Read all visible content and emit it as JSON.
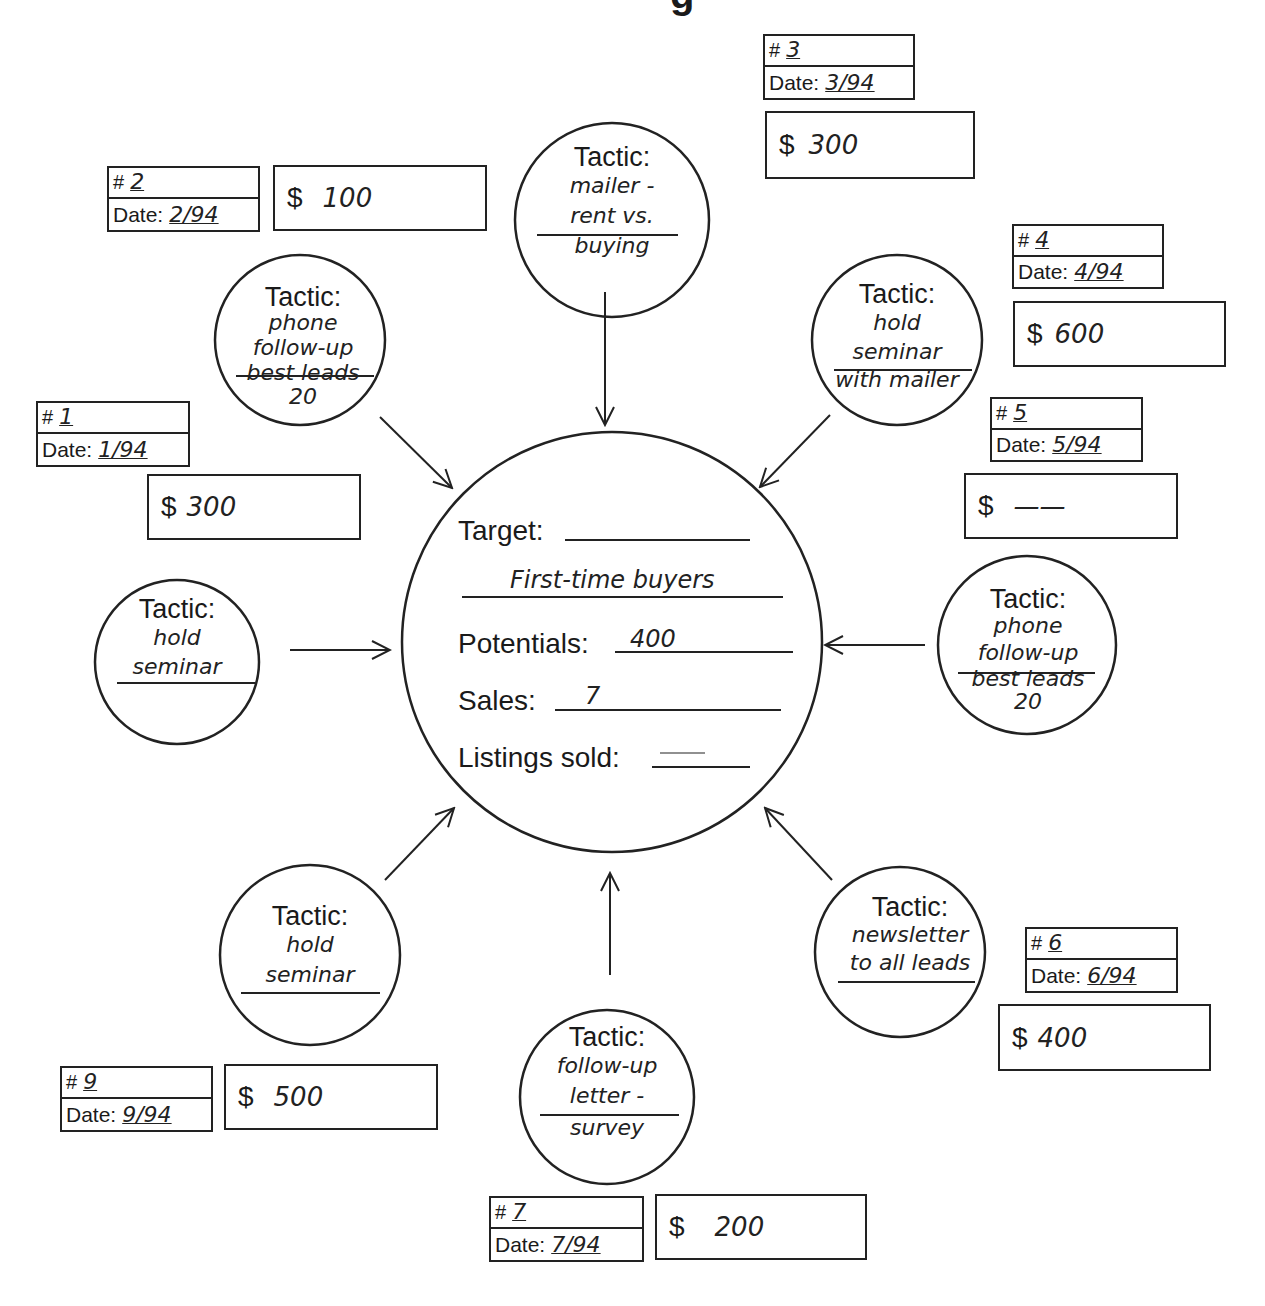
{
  "title_fragment": "g",
  "center": {
    "target_label": "Target:",
    "target_value": "First-time buyers",
    "potentials_label": "Potentials:",
    "potentials_value": "400",
    "sales_label": "Sales:",
    "sales_value": "7",
    "listings_label": "Listings sold:",
    "listings_value": "—"
  },
  "tactics": [
    {
      "number": "1",
      "date": "1/94",
      "cost": "300",
      "label": "Tactic:",
      "lines": [
        "hold",
        "seminar"
      ],
      "position": "left"
    },
    {
      "number": "2",
      "date": "2/94",
      "cost": "100",
      "label": "Tactic:",
      "lines": [
        "phone",
        "follow-up",
        "best leads",
        "20"
      ],
      "position": "top-left"
    },
    {
      "number": "3",
      "date": "3/94",
      "cost": "300",
      "label": "Tactic:",
      "lines": [
        "mailer -",
        "rent vs.",
        "buying"
      ],
      "position": "top"
    },
    {
      "number": "4",
      "date": "4/94",
      "cost": "600",
      "label": "Tactic:",
      "lines": [
        "hold",
        "seminar",
        "with mailer"
      ],
      "position": "top-right"
    },
    {
      "number": "5",
      "date": "5/94",
      "cost": "——",
      "label": "Tactic:",
      "lines": [
        "phone",
        "follow-up",
        "best leads",
        "20"
      ],
      "position": "right"
    },
    {
      "number": "6",
      "date": "6/94",
      "cost": "400",
      "label": "Tactic:",
      "lines": [
        "newsletter",
        "to all leads"
      ],
      "position": "bottom-right"
    },
    {
      "number": "7",
      "date": "7/94",
      "cost": "200",
      "label": "Tactic:",
      "lines": [
        "follow-up",
        "letter -",
        "survey"
      ],
      "position": "bottom"
    },
    {
      "number": "9",
      "date": "9/94",
      "cost": "500",
      "label": "Tactic:",
      "lines": [
        "hold",
        "seminar"
      ],
      "position": "bottom-left"
    }
  ],
  "labels": {
    "hash": "#",
    "date": "Date:",
    "dollar": "$"
  }
}
